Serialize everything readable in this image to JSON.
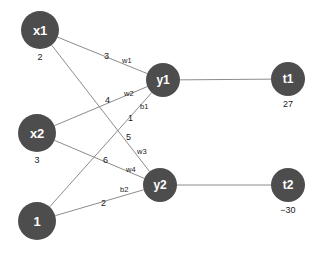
{
  "diagram": {
    "node_color": "#4d4d4d",
    "edge_color": "#8c8c8c",
    "text_color": "#1a1a1a",
    "nodes": [
      {
        "id": "x1",
        "label": "x1",
        "value": "2",
        "cx": 40,
        "cy": 30,
        "r": 19,
        "font": 13
      },
      {
        "id": "x2",
        "label": "x2",
        "value": "3",
        "cx": 37,
        "cy": 133,
        "r": 19,
        "font": 13
      },
      {
        "id": "b",
        "label": "1",
        "value": "",
        "cx": 37,
        "cy": 221,
        "r": 19,
        "font": 13
      },
      {
        "id": "y1",
        "label": "y1",
        "value": "",
        "cx": 163,
        "cy": 80,
        "r": 17,
        "font": 12
      },
      {
        "id": "y2",
        "label": "y2",
        "value": "",
        "cx": 160,
        "cy": 185,
        "r": 17,
        "font": 12
      },
      {
        "id": "t1",
        "label": "t1",
        "value": "27",
        "cx": 288,
        "cy": 79,
        "r": 17,
        "font": 12
      },
      {
        "id": "t2",
        "label": "t2",
        "value": "−30",
        "cx": 288,
        "cy": 185,
        "r": 17,
        "font": 12
      }
    ],
    "edges": [
      {
        "id": "x1-y1",
        "from": "x1",
        "to": "y1",
        "weight_value": "3",
        "weight_name": "w1"
      },
      {
        "id": "x1-y2",
        "from": "x1",
        "to": "y2",
        "weight_value": "5",
        "weight_name": "w3"
      },
      {
        "id": "x2-y1",
        "from": "x2",
        "to": "y1",
        "weight_value": "4",
        "weight_name": "w2"
      },
      {
        "id": "x2-y2",
        "from": "x2",
        "to": "y2",
        "weight_value": "6",
        "weight_name": "w4"
      },
      {
        "id": "b-y1",
        "from": "b",
        "to": "y1",
        "weight_value": "1",
        "weight_name": "b1"
      },
      {
        "id": "b-y2",
        "from": "b",
        "to": "y2",
        "weight_value": "2",
        "weight_name": "b2"
      },
      {
        "id": "y1-t1",
        "from": "y1",
        "to": "t1",
        "weight_value": "",
        "weight_name": ""
      },
      {
        "id": "y2-t2",
        "from": "y2",
        "to": "t2",
        "weight_value": "",
        "weight_name": ""
      }
    ],
    "edge_labels": [
      {
        "id": "lbl-3",
        "text": "3",
        "x": 104,
        "y": 52,
        "kind": "num"
      },
      {
        "id": "lbl-w1",
        "text": "w1",
        "x": 122,
        "y": 57,
        "kind": "w"
      },
      {
        "id": "lbl-4",
        "text": "4",
        "x": 105,
        "y": 96,
        "kind": "num"
      },
      {
        "id": "lbl-w2",
        "text": "w2",
        "x": 124,
        "y": 90,
        "kind": "w"
      },
      {
        "id": "lbl-b1",
        "text": "b1",
        "x": 140,
        "y": 103,
        "kind": "w"
      },
      {
        "id": "lbl-1",
        "text": "1",
        "x": 128,
        "y": 114,
        "kind": "num"
      },
      {
        "id": "lbl-5",
        "text": "5",
        "x": 126,
        "y": 133,
        "kind": "num"
      },
      {
        "id": "lbl-w3",
        "text": "w3",
        "x": 137,
        "y": 148,
        "kind": "w"
      },
      {
        "id": "lbl-6",
        "text": "6",
        "x": 103,
        "y": 156,
        "kind": "num"
      },
      {
        "id": "lbl-w4",
        "text": "w4",
        "x": 126,
        "y": 166,
        "kind": "w"
      },
      {
        "id": "lbl-b2",
        "text": "b2",
        "x": 120,
        "y": 186,
        "kind": "w"
      },
      {
        "id": "lbl-2",
        "text": "2",
        "x": 101,
        "y": 199,
        "kind": "num"
      }
    ]
  }
}
